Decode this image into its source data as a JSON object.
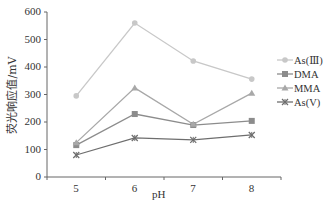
{
  "chart_data": {
    "type": "line",
    "title": "",
    "xlabel": "pH",
    "ylabel": "荧光响应值/mV",
    "categories": [
      "5",
      "6",
      "7",
      "8"
    ],
    "ylim": [
      0,
      600
    ],
    "yticks": [
      "0",
      "100",
      "200",
      "300",
      "400",
      "500",
      "600"
    ],
    "grid": false,
    "legend_position": "right",
    "series": [
      {
        "name": "As(Ⅲ)",
        "marker": "circle",
        "color": "#c8c8c8",
        "values": [
          295,
          560,
          422,
          356
        ]
      },
      {
        "name": "DMA",
        "marker": "square",
        "color": "#8c8c8c",
        "values": [
          116,
          229,
          189,
          204
        ]
      },
      {
        "name": "MMA",
        "marker": "triangle",
        "color": "#a8a8a8",
        "values": [
          125,
          324,
          192,
          305
        ]
      },
      {
        "name": "As(V)",
        "marker": "x",
        "color": "#6e6e6e",
        "values": [
          80,
          142,
          135,
          153
        ]
      }
    ]
  }
}
